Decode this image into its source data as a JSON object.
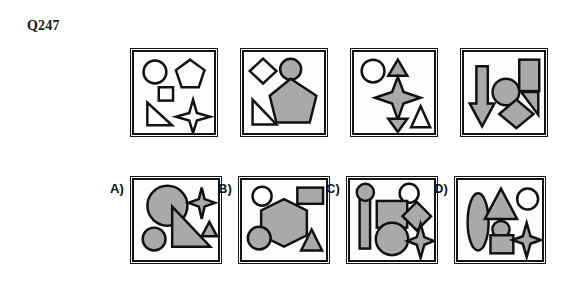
{
  "question": {
    "label": "Q247"
  },
  "colors": {
    "fill_gray": "#a9a9a9",
    "outline_black": "#111111",
    "panel_background": "#fdfdfd"
  },
  "sequence": {
    "panels": [
      {
        "name": "sequence-panel-1",
        "shapes": [
          {
            "type": "circle",
            "fill": "outline",
            "position": "top-left"
          },
          {
            "type": "pentagon",
            "fill": "outline",
            "position": "top-right"
          },
          {
            "type": "square",
            "fill": "outline",
            "position": "center-left"
          },
          {
            "type": "right-triangle",
            "fill": "outline",
            "position": "bottom-left"
          },
          {
            "type": "four-point-star",
            "fill": "outline",
            "position": "bottom-right"
          }
        ]
      },
      {
        "name": "sequence-panel-2",
        "shapes": [
          {
            "type": "diamond",
            "fill": "outline",
            "position": "top-left"
          },
          {
            "type": "circle",
            "fill": "gray",
            "position": "top-center"
          },
          {
            "type": "pentagon",
            "fill": "gray",
            "position": "center-right"
          },
          {
            "type": "right-triangle",
            "fill": "outline",
            "position": "bottom-left"
          }
        ]
      },
      {
        "name": "sequence-panel-3",
        "shapes": [
          {
            "type": "circle",
            "fill": "outline",
            "position": "top-left"
          },
          {
            "type": "triangle-up",
            "fill": "gray",
            "position": "top-center"
          },
          {
            "type": "four-point-star",
            "fill": "gray",
            "position": "center"
          },
          {
            "type": "triangle-down",
            "fill": "gray",
            "position": "bottom-center"
          },
          {
            "type": "triangle-up",
            "fill": "outline",
            "position": "bottom-right"
          }
        ]
      },
      {
        "name": "sequence-panel-4",
        "shapes": [
          {
            "type": "down-arrow",
            "fill": "gray",
            "position": "left"
          },
          {
            "type": "circle",
            "fill": "gray",
            "position": "center"
          },
          {
            "type": "rectangle",
            "fill": "gray",
            "position": "top-right"
          },
          {
            "type": "right-triangle",
            "fill": "gray",
            "position": "center-right"
          },
          {
            "type": "diamond",
            "fill": "gray",
            "position": "bottom-right"
          }
        ]
      }
    ]
  },
  "answers": {
    "options": [
      {
        "letter": "A)",
        "name": "answer-option-a",
        "shapes": [
          {
            "type": "circle",
            "fill": "gray",
            "position": "top-left-large"
          },
          {
            "type": "four-point-star",
            "fill": "gray",
            "position": "top-right"
          },
          {
            "type": "right-triangle",
            "fill": "gray",
            "position": "center"
          },
          {
            "type": "circle",
            "fill": "gray",
            "position": "bottom-left-small"
          },
          {
            "type": "triangle-up",
            "fill": "gray",
            "position": "right-small"
          }
        ]
      },
      {
        "letter": "B)",
        "name": "answer-option-b",
        "shapes": [
          {
            "type": "circle",
            "fill": "outline",
            "position": "top-left"
          },
          {
            "type": "rectangle",
            "fill": "gray",
            "position": "top-right"
          },
          {
            "type": "hexagon",
            "fill": "gray",
            "position": "center"
          },
          {
            "type": "circle",
            "fill": "gray",
            "position": "bottom-left"
          },
          {
            "type": "triangle-up",
            "fill": "gray",
            "position": "bottom-right"
          }
        ]
      },
      {
        "letter": "C)",
        "name": "answer-option-c",
        "shapes": [
          {
            "type": "pin-bar-circle",
            "fill": "gray",
            "position": "left"
          },
          {
            "type": "circle",
            "fill": "outline",
            "position": "top-right"
          },
          {
            "type": "square",
            "fill": "gray",
            "position": "center"
          },
          {
            "type": "diamond",
            "fill": "gray",
            "position": "center-right"
          },
          {
            "type": "circle",
            "fill": "gray",
            "position": "bottom-center"
          },
          {
            "type": "four-point-star",
            "fill": "gray",
            "position": "bottom-right"
          }
        ]
      },
      {
        "letter": "D)",
        "name": "answer-option-d",
        "shapes": [
          {
            "type": "ellipse",
            "fill": "gray",
            "position": "left"
          },
          {
            "type": "triangle-up",
            "fill": "gray",
            "position": "top-center"
          },
          {
            "type": "circle",
            "fill": "outline",
            "position": "top-right"
          },
          {
            "type": "circle",
            "fill": "gray",
            "position": "bottom-center-small"
          },
          {
            "type": "square",
            "fill": "gray",
            "position": "bottom-center"
          },
          {
            "type": "four-point-star",
            "fill": "gray",
            "position": "bottom-right"
          }
        ]
      }
    ]
  }
}
